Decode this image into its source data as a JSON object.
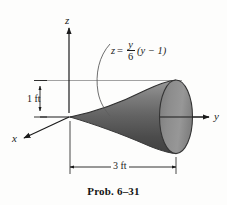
{
  "figure": {
    "caption": "Prob. 6–31",
    "axes": {
      "z_label": "z",
      "y_label": "y",
      "x_label": "x"
    },
    "equation": {
      "lhs": "z",
      "equals": "=",
      "fraction_numerator": "y",
      "fraction_denominator": "6",
      "trailing": "(y − 1)",
      "plain_text": "z = (y/6)(y − 1)"
    },
    "dimensions": [
      {
        "name": "height",
        "label": "1 ft",
        "orientation": "vertical",
        "value": 1,
        "unit": "ft"
      },
      {
        "name": "length",
        "label": "3 ft",
        "orientation": "horizontal",
        "value": 3,
        "unit": "ft"
      }
    ],
    "colors": {
      "ink": "#1b1b1b",
      "background": "#fdfdfc",
      "body_light": "#8c8c8c",
      "body_mid": "#6a6a6a",
      "body_dark": "#454545",
      "face_fill": "#8e8e8e",
      "outline": "#3a3a3a",
      "thin_rule": "#8a8a8a"
    },
    "solid": {
      "name": "horn-solid-of-revolution",
      "description": "solid of revolution generated by z = (y/6)(y - 1) about the y axis, 3 ft long, 1 ft radius at the open end"
    }
  }
}
